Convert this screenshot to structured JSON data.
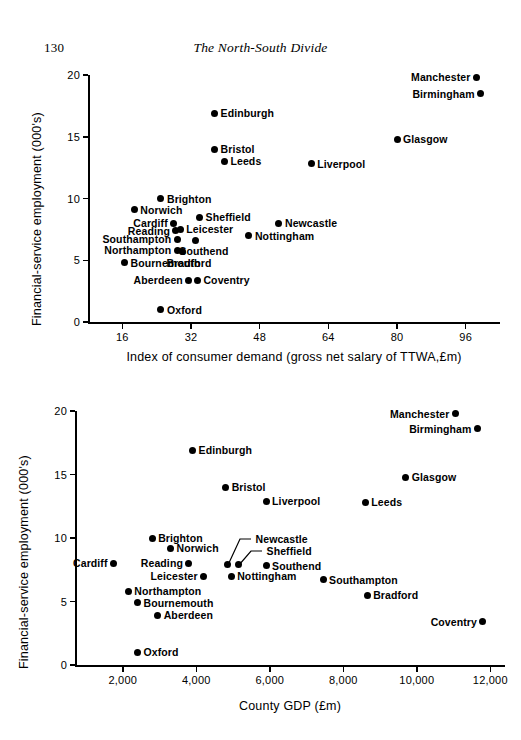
{
  "page": {
    "number": "130",
    "running_head": "The North-South Divide"
  },
  "chart_data": [
    {
      "id": "chart-1",
      "type": "scatter",
      "title": "",
      "xlabel": "Index of consumer demand (gross net salary of TTWA,£m)",
      "ylabel": "Financial-service employment (000's)",
      "xticks": [
        "16",
        "32",
        "48",
        "64",
        "80",
        "96"
      ],
      "xtick_values": [
        16,
        32,
        48,
        64,
        80,
        96
      ],
      "yticks": [
        "0",
        "5",
        "10",
        "15",
        "20"
      ],
      "ytick_values": [
        0,
        5,
        10,
        15,
        20
      ],
      "xlim": [
        8,
        104
      ],
      "ylim": [
        0,
        20
      ],
      "grid": false,
      "legend": "none",
      "points": [
        {
          "label": "Manchester",
          "x": 98.5,
          "y": 19.8,
          "side": "left"
        },
        {
          "label": "Birmingham",
          "x": 99.5,
          "y": 18.5,
          "side": "left"
        },
        {
          "label": "Edinburgh",
          "x": 37.5,
          "y": 16.9,
          "side": "right"
        },
        {
          "label": "Glasgow",
          "x": 80.0,
          "y": 14.8,
          "side": "right"
        },
        {
          "label": "Bristol",
          "x": 37.5,
          "y": 14.0,
          "side": "right"
        },
        {
          "label": "Leeds",
          "x": 39.8,
          "y": 13.0,
          "side": "right"
        },
        {
          "label": "Liverpool",
          "x": 60.0,
          "y": 12.8,
          "side": "right"
        },
        {
          "label": "Brighton",
          "x": 25.0,
          "y": 10.0,
          "side": "right"
        },
        {
          "label": "Norwich",
          "x": 18.8,
          "y": 9.1,
          "side": "right"
        },
        {
          "label": "Sheffield",
          "x": 34.0,
          "y": 8.5,
          "side": "right"
        },
        {
          "label": "Newcastle",
          "x": 52.5,
          "y": 8.0,
          "side": "right"
        },
        {
          "label": "Cardiff",
          "x": 28.0,
          "y": 8.0,
          "side": "left"
        },
        {
          "label": "Leicester",
          "x": 29.5,
          "y": 7.5,
          "side": "right"
        },
        {
          "label": "Reading",
          "x": 28.5,
          "y": 7.4,
          "side": "left"
        },
        {
          "label": "Nottingham",
          "x": 45.5,
          "y": 7.0,
          "side": "right"
        },
        {
          "label": "Southampton",
          "x": 28.8,
          "y": 6.7,
          "side": "left"
        },
        {
          "label": "Southend",
          "x": 33.0,
          "y": 6.6,
          "side": "below"
        },
        {
          "label": "Northampton",
          "x": 28.8,
          "y": 5.8,
          "side": "left"
        },
        {
          "label": "Bradford",
          "x": 30.0,
          "y": 5.7,
          "side": "below"
        },
        {
          "label": "Bournemouth",
          "x": 16.5,
          "y": 4.8,
          "side": "right"
        },
        {
          "label": "Aberdeen",
          "x": 31.5,
          "y": 3.4,
          "side": "left"
        },
        {
          "label": "Coventry",
          "x": 33.5,
          "y": 3.4,
          "side": "right"
        },
        {
          "label": "Oxford",
          "x": 25.0,
          "y": 1.0,
          "side": "right"
        }
      ]
    },
    {
      "id": "chart-2",
      "type": "scatter",
      "title": "",
      "xlabel": "County GDP (£m)",
      "ylabel": "Financial-service employment (000's)",
      "xticks": [
        "2,000",
        "4,000",
        "6,000",
        "8,000",
        "10,000",
        "12,000"
      ],
      "xtick_values": [
        2000,
        4000,
        6000,
        8000,
        10000,
        12000
      ],
      "yticks": [
        "0",
        "5",
        "10",
        "15",
        "20"
      ],
      "ytick_values": [
        0,
        5,
        10,
        15,
        20
      ],
      "xlim": [
        700,
        12400
      ],
      "ylim": [
        0,
        20
      ],
      "grid": false,
      "legend": "none",
      "points": [
        {
          "label": "Manchester",
          "x": 11050,
          "y": 19.8,
          "side": "left"
        },
        {
          "label": "Birmingham",
          "x": 11650,
          "y": 18.6,
          "side": "left"
        },
        {
          "label": "Edinburgh",
          "x": 3900,
          "y": 16.9,
          "side": "right"
        },
        {
          "label": "Glasgow",
          "x": 9700,
          "y": 14.8,
          "side": "right"
        },
        {
          "label": "Bristol",
          "x": 4800,
          "y": 14.0,
          "side": "right"
        },
        {
          "label": "Liverpool",
          "x": 5900,
          "y": 12.9,
          "side": "right"
        },
        {
          "label": "Leeds",
          "x": 8600,
          "y": 12.8,
          "side": "right"
        },
        {
          "label": "Brighton",
          "x": 2800,
          "y": 10.0,
          "side": "right"
        },
        {
          "label": "Norwich",
          "x": 3300,
          "y": 9.2,
          "side": "right"
        },
        {
          "label": "Cardiff",
          "x": 1750,
          "y": 8.0,
          "side": "left"
        },
        {
          "label": "Reading",
          "x": 3800,
          "y": 8.0,
          "side": "left"
        },
        {
          "label": "Newcastle",
          "x": 4850,
          "y": 7.9,
          "side": "leader"
        },
        {
          "label": "Sheffield",
          "x": 5150,
          "y": 7.9,
          "side": "leader"
        },
        {
          "label": "Southend",
          "x": 5900,
          "y": 7.8,
          "side": "right"
        },
        {
          "label": "Leicester",
          "x": 4200,
          "y": 7.0,
          "side": "left"
        },
        {
          "label": "Nottingham",
          "x": 4950,
          "y": 7.0,
          "side": "right"
        },
        {
          "label": "Southampton",
          "x": 7450,
          "y": 6.7,
          "side": "right"
        },
        {
          "label": "Northampton",
          "x": 2150,
          "y": 5.8,
          "side": "right"
        },
        {
          "label": "Bradford",
          "x": 8650,
          "y": 5.5,
          "side": "right"
        },
        {
          "label": "Bournemouth",
          "x": 2400,
          "y": 4.9,
          "side": "right"
        },
        {
          "label": "Aberdeen",
          "x": 2950,
          "y": 3.9,
          "side": "right"
        },
        {
          "label": "Coventry",
          "x": 11800,
          "y": 3.4,
          "side": "left"
        },
        {
          "label": "Oxford",
          "x": 2400,
          "y": 1.0,
          "side": "right"
        }
      ]
    }
  ]
}
